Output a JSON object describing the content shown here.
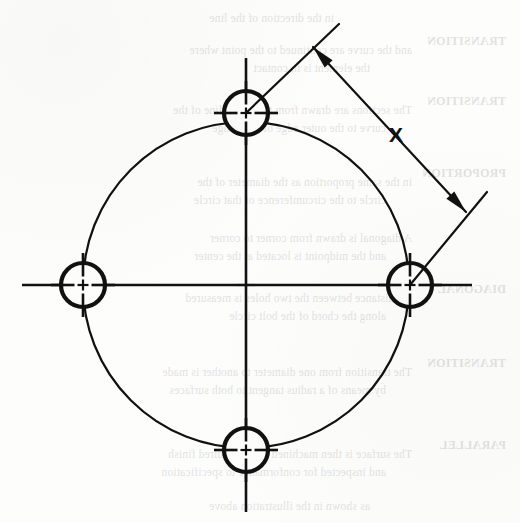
{
  "page": {
    "width": 520,
    "height": 523,
    "background_color": "#fdfdfc",
    "ink_color": "#111111"
  },
  "drawing": {
    "title": "Bolt circle hole pattern with chord dimension",
    "type": "engineering-line-drawing",
    "dimension_label": "X",
    "center": {
      "x": 246,
      "y": 285
    },
    "bolt_circle": {
      "radius": 163,
      "stroke_width": 2.2,
      "style": "solid-thin"
    },
    "holes": [
      {
        "name": "hole-top",
        "cx": 246,
        "cy": 113,
        "r": 22,
        "stroke_width": 4.2
      },
      {
        "name": "hole-right",
        "cx": 410,
        "cy": 285,
        "r": 22,
        "stroke_width": 4.2
      },
      {
        "name": "hole-bottom",
        "cx": 246,
        "cy": 450,
        "r": 22,
        "stroke_width": 4.2
      },
      {
        "name": "hole-left",
        "cx": 83,
        "cy": 285,
        "r": 22,
        "stroke_width": 4.2
      }
    ],
    "centerlines": {
      "vertical": {
        "x": 246,
        "y1": 58,
        "y2": 512
      },
      "horizontal": {
        "y": 285,
        "x1": 22,
        "x2": 472
      },
      "stroke_width": 2.6
    },
    "dimension": {
      "label": "X",
      "label_x": 396,
      "label_y": 142,
      "extension_line_top": {
        "x1": 246,
        "y1": 113,
        "x2": 339,
        "y2": 24
      },
      "extension_line_right": {
        "x1": 410,
        "y1": 285,
        "x2": 487,
        "y2": 192
      },
      "dimension_line": {
        "x1": 313,
        "y1": 47,
        "x2": 466,
        "y2": 212
      },
      "arrow_head_upper": {
        "x": 313,
        "y": 47,
        "direction": "up-left"
      },
      "arrow_head_lower": {
        "x": 466,
        "y": 212,
        "direction": "down-right"
      },
      "stroke_width": 2.2
    }
  },
  "bleed_through": {
    "note": "Mirrored show-through text from the reverse side of the page (illegible)",
    "heads": [
      {
        "text": "TRANSITION",
        "x": 14,
        "y": 34
      },
      {
        "text": "TRANSITION",
        "x": 14,
        "y": 94
      },
      {
        "text": "PROPORTION",
        "x": 14,
        "y": 166
      },
      {
        "text": "DIAGONAL",
        "x": 14,
        "y": 282
      },
      {
        "text": "TRANSITION",
        "x": 14,
        "y": 356
      },
      {
        "text": "PARALLEL",
        "x": 14,
        "y": 438
      }
    ],
    "lines": [
      {
        "text": "in the direction of the line",
        "x": 186,
        "y": 12
      },
      {
        "text": "and the curve are continued to the point where",
        "x": 108,
        "y": 44
      },
      {
        "text": "the element is in contact",
        "x": 150,
        "y": 62
      },
      {
        "text": "The sections are drawn from the center line of the",
        "x": 108,
        "y": 104
      },
      {
        "text": "curve to the outer edge of the flange",
        "x": 134,
        "y": 122
      },
      {
        "text": "in the same proportion as the diameter of the",
        "x": 108,
        "y": 176
      },
      {
        "text": "circle to the circumference of that circle",
        "x": 134,
        "y": 194
      },
      {
        "text": "A diagonal is drawn from corner to corner",
        "x": 108,
        "y": 232
      },
      {
        "text": "and the midpoint is located at the center",
        "x": 134,
        "y": 250
      },
      {
        "text": "the distance between the two holes is measured",
        "x": 108,
        "y": 292
      },
      {
        "text": "along the chord of the bolt circle",
        "x": 134,
        "y": 310
      },
      {
        "text": "The transition from one diameter to another is made",
        "x": 108,
        "y": 366
      },
      {
        "text": "by means of a radius tangent to both surfaces",
        "x": 134,
        "y": 384
      },
      {
        "text": "The surface is then machined to the required finish",
        "x": 108,
        "y": 448
      },
      {
        "text": "and inspected for conformance to specification",
        "x": 134,
        "y": 466
      },
      {
        "text": "as shown in the illustration above",
        "x": 150,
        "y": 500
      }
    ]
  }
}
